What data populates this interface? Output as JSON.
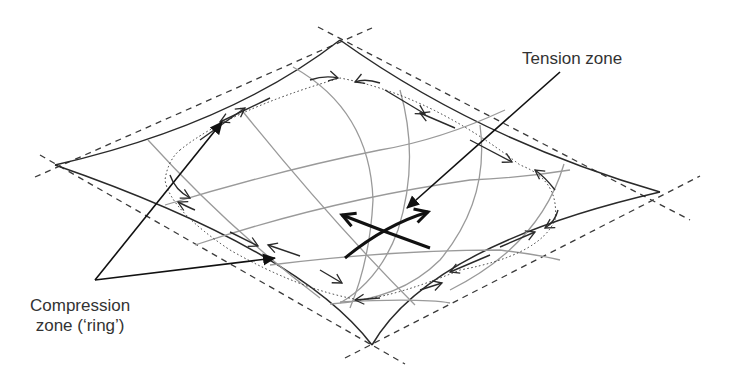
{
  "diagram": {
    "labels": {
      "tension": "Tension zone",
      "compression_line1": "Compression",
      "compression_line2": "zone (‘ring’)"
    },
    "colors": {
      "edge": "#2a2a2a",
      "dashed": "#3a3a3a",
      "grid": "#9a9a9a",
      "arrow": "#1a1a1a"
    },
    "corners": {
      "top": [
        340,
        40
      ],
      "left": [
        55,
        165
      ],
      "right": [
        660,
        192
      ],
      "bottom": [
        372,
        345
      ]
    }
  }
}
